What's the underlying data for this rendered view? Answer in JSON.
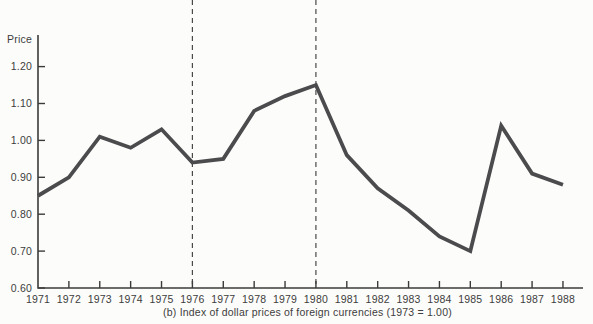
{
  "figure": {
    "y_axis_title": "Price",
    "caption": "(b)  Index of dollar prices of foreign currencies (1973 = 1.00)"
  },
  "chart_data": {
    "type": "line",
    "title": "",
    "ylabel": "Price",
    "xlabel": "(b) Index of dollar prices of foreign currencies (1973 = 1.00)",
    "x": [
      1971,
      1972,
      1973,
      1974,
      1975,
      1976,
      1977,
      1978,
      1979,
      1980,
      1981,
      1982,
      1983,
      1984,
      1985,
      1986,
      1987,
      1988
    ],
    "values": [
      0.85,
      0.9,
      1.01,
      0.98,
      1.03,
      0.94,
      0.95,
      1.08,
      1.12,
      1.15,
      0.96,
      0.87,
      0.81,
      0.74,
      0.7,
      1.04,
      0.91,
      0.88
    ],
    "ylim": [
      0.6,
      1.2
    ],
    "y_tick_values": [
      1.2,
      1.1,
      1.0,
      0.9,
      0.8,
      0.7,
      0.6
    ],
    "y_tick_labels": [
      "1.20",
      "1.10",
      "1.00",
      "0.90",
      "0.80",
      "0.70",
      "0.60"
    ],
    "grid": false,
    "legend": "none",
    "reference_lines": [
      {
        "style": "vertical-dashed",
        "x": 1976
      },
      {
        "style": "vertical-dashed",
        "x": 1980
      }
    ],
    "colors": {
      "line": "#4b4b4d",
      "axis": "#3b3b3b",
      "dashed": "#4a4a4a",
      "text": "#3d3d3d",
      "background": "#fcfcfa"
    }
  }
}
